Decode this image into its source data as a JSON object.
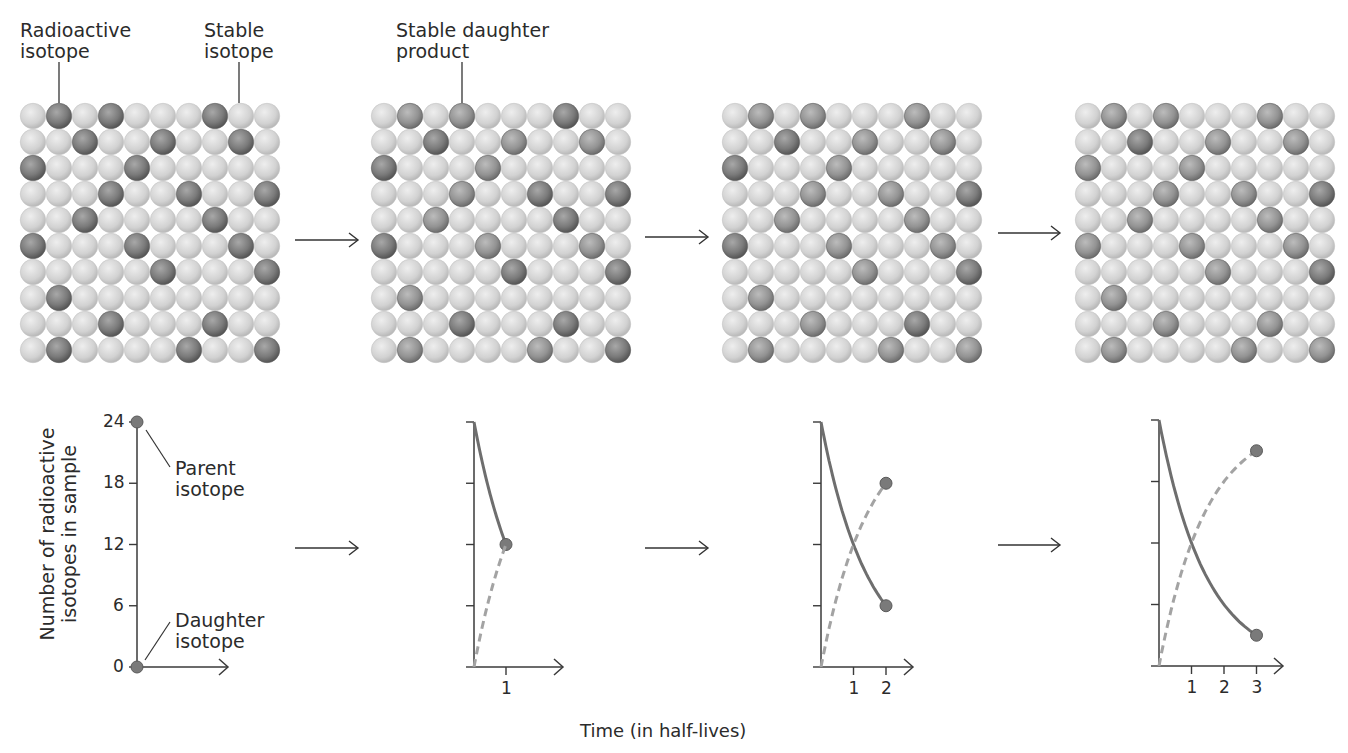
{
  "labels": {
    "radioactive_isotope": [
      "Radioactive",
      "isotope"
    ],
    "stable_isotope": [
      "Stable",
      "isotope"
    ],
    "stable_daughter_product": [
      "Stable daughter",
      "product"
    ],
    "parent_isotope": [
      "Parent",
      "isotope"
    ],
    "daughter_isotope": [
      "Daughter",
      "isotope"
    ],
    "y_axis_label": [
      "Number of radioactive",
      "isotopes in sample"
    ],
    "x_axis_label": "Time (in half-lives)"
  },
  "colors": {
    "stable_sphere": "#d4d4d4",
    "radioactive_sphere": "#7c7c7c",
    "daughter_sphere": "#9a9a9a",
    "parent_curve": "#6e6e6e",
    "daughter_curve": "#a3a3a3",
    "axis": "#3a3a3a"
  },
  "grid": {
    "rows": 10,
    "cols": 10,
    "sphere_pitch_px": 26,
    "radioactive_positions": [
      [
        0,
        1
      ],
      [
        0,
        3
      ],
      [
        0,
        7
      ],
      [
        1,
        2
      ],
      [
        1,
        5
      ],
      [
        1,
        8
      ],
      [
        2,
        0
      ],
      [
        2,
        4
      ],
      [
        3,
        3
      ],
      [
        3,
        6
      ],
      [
        3,
        9
      ],
      [
        4,
        2
      ],
      [
        4,
        7
      ],
      [
        5,
        0
      ],
      [
        5,
        4
      ],
      [
        5,
        8
      ],
      [
        6,
        5
      ],
      [
        6,
        9
      ],
      [
        7,
        1
      ],
      [
        8,
        3
      ],
      [
        8,
        7
      ],
      [
        9,
        1
      ],
      [
        9,
        6
      ],
      [
        9,
        9
      ]
    ]
  },
  "panels": [
    {
      "half_lives_elapsed": 0,
      "grid_origin": [
        20,
        103
      ],
      "parent_remaining": 24,
      "daughter_count": 0
    },
    {
      "half_lives_elapsed": 1,
      "grid_origin": [
        371,
        103
      ],
      "parent_remaining": 12,
      "daughter_count": 12
    },
    {
      "half_lives_elapsed": 2,
      "grid_origin": [
        722,
        103
      ],
      "parent_remaining": 6,
      "daughter_count": 18
    },
    {
      "half_lives_elapsed": 3,
      "grid_origin": [
        1075,
        103
      ],
      "parent_remaining": 3,
      "daughter_count": 21
    }
  ],
  "chart_data": {
    "type": "line",
    "title": "",
    "xlabel": "Time (in half-lives)",
    "ylabel": "Number of radioactive isotopes in sample",
    "y_ticks": [
      0,
      6,
      12,
      18,
      24
    ],
    "ylim": [
      0,
      24
    ],
    "grid": false,
    "panels": [
      {
        "x_ticks": [],
        "x": [
          0
        ],
        "series": [
          {
            "name": "Parent isotope",
            "style": "solid",
            "values": [
              24
            ]
          },
          {
            "name": "Daughter isotope",
            "style": "dashed",
            "values": [
              0
            ]
          }
        ]
      },
      {
        "x_ticks": [
          1
        ],
        "x": [
          0,
          1
        ],
        "series": [
          {
            "name": "Parent isotope",
            "style": "solid",
            "values": [
              24,
              12
            ]
          },
          {
            "name": "Daughter isotope",
            "style": "dashed",
            "values": [
              0,
              12
            ]
          }
        ]
      },
      {
        "x_ticks": [
          1,
          2
        ],
        "x": [
          0,
          1,
          2
        ],
        "series": [
          {
            "name": "Parent isotope",
            "style": "solid",
            "values": [
              24,
              12,
              6
            ]
          },
          {
            "name": "Daughter isotope",
            "style": "dashed",
            "values": [
              0,
              12,
              18
            ]
          }
        ]
      },
      {
        "x_ticks": [
          1,
          2,
          3
        ],
        "x": [
          0,
          1,
          2,
          3
        ],
        "series": [
          {
            "name": "Parent isotope",
            "style": "solid",
            "values": [
              24,
              12,
              6,
              3
            ]
          },
          {
            "name": "Daughter isotope",
            "style": "dashed",
            "values": [
              0,
              12,
              18,
              21
            ]
          }
        ]
      }
    ]
  },
  "graph_layout": [
    {
      "axis_x": 137,
      "top_y": 422,
      "base_y": 667,
      "x_unit": 32,
      "arrow_end": 228
    },
    {
      "axis_x": 474,
      "top_y": 422,
      "base_y": 667,
      "x_unit": 32,
      "arrow_end": 563
    },
    {
      "axis_x": 821,
      "top_y": 422,
      "base_y": 667,
      "x_unit": 32.5,
      "arrow_end": 913
    },
    {
      "axis_x": 1159,
      "top_y": 420,
      "base_y": 666,
      "x_unit": 32.5,
      "arrow_end": 1283
    }
  ],
  "arrows": [
    {
      "x1": 295,
      "x2": 358,
      "y": 240
    },
    {
      "x1": 645,
      "x2": 708,
      "y": 237
    },
    {
      "x1": 998,
      "x2": 1060,
      "y": 233
    },
    {
      "x1": 295,
      "x2": 358,
      "y": 548
    },
    {
      "x1": 645,
      "x2": 708,
      "y": 548
    },
    {
      "x1": 998,
      "x2": 1060,
      "y": 545
    }
  ]
}
